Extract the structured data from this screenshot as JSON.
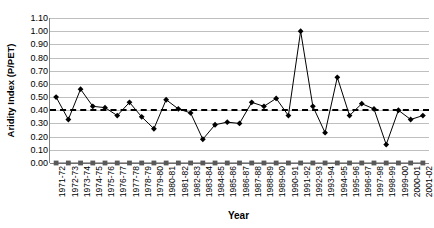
{
  "chart_data": {
    "type": "line",
    "title": "",
    "xlabel": "Year",
    "ylabel": "Aridity Index (P/PET)",
    "ylim": [
      0.0,
      1.1
    ],
    "ytick_labels": [
      "1.10",
      "1.00",
      "0.90",
      "0.80",
      "0.70",
      "0.60",
      "0.50",
      "0.40",
      "0.30",
      "0.20",
      "0.10",
      "0.00"
    ],
    "ytick_values": [
      1.1,
      1.0,
      0.9,
      0.8,
      0.7,
      0.6,
      0.5,
      0.4,
      0.3,
      0.2,
      0.1,
      0.0
    ],
    "grid": true,
    "legend": "none",
    "categories": [
      "1971-72",
      "1972-73",
      "1973-74",
      "1974-75",
      "1975-76",
      "1976-77",
      "1977-78",
      "1978-79",
      "1979-80",
      "1980-81",
      "1981-82",
      "1982-83",
      "1983-84",
      "1984-85",
      "1985-86",
      "1986-87",
      "1987-88",
      "1988-89",
      "1989-90",
      "1990-91",
      "1991-92",
      "1992-93",
      "1993-94",
      "1994-95",
      "1995-96",
      "1996-97",
      "1997-98",
      "1998-99",
      "1999-00",
      "2000-01",
      "2001-02"
    ],
    "series": [
      {
        "name": "Aridity Index (P/PET)",
        "marker": "diamond",
        "color": "#000000",
        "values": [
          0.5,
          0.33,
          0.56,
          0.43,
          0.42,
          0.36,
          0.46,
          0.35,
          0.26,
          0.48,
          0.41,
          0.38,
          0.18,
          0.29,
          0.31,
          0.3,
          0.46,
          0.43,
          0.49,
          0.36,
          1.0,
          0.43,
          0.23,
          0.65,
          0.36,
          0.45,
          0.41,
          0.14,
          0.4,
          0.33,
          0.36
        ]
      },
      {
        "name": "Baseline",
        "marker": "square",
        "color": "#595959",
        "values": [
          0.0,
          0.0,
          0.0,
          0.0,
          0.0,
          0.0,
          0.0,
          0.0,
          0.0,
          0.0,
          0.0,
          0.0,
          0.0,
          0.0,
          0.0,
          0.0,
          0.0,
          0.0,
          0.0,
          0.0,
          0.0,
          0.0,
          0.0,
          0.0,
          0.0,
          0.0,
          0.0,
          0.0,
          0.0,
          0.0,
          0.0
        ]
      }
    ],
    "annotations": [
      {
        "type": "horizontal-dashed-line",
        "label": "mean",
        "value": 0.41
      }
    ]
  }
}
